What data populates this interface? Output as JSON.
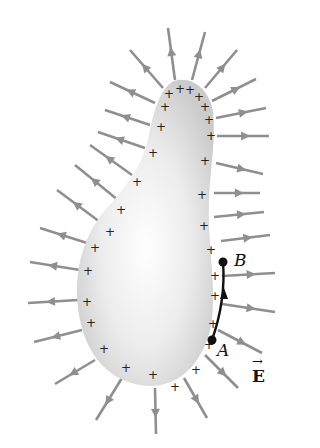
{
  "diagram": {
    "title": "",
    "colors": {
      "background": "#ffffff",
      "conductor_edge": "#c9c9c9",
      "conductor_center": "#ffffff",
      "field_line": "#8f8f8f",
      "charge_mark": "#222222",
      "path": "#111111"
    },
    "labels": {
      "point_a": "A",
      "point_b": "B",
      "field": "E",
      "field_vector_arrow": "→"
    },
    "charge_symbol": "+",
    "conductor_outline": "M178,80 C196,78 210,92 213,112 C216,140 210,170 209,200 C207,240 216,280 212,320 C208,350 188,385 152,386 C115,386 88,360 80,320 C72,280 80,240 105,210 C125,188 140,170 148,140 C152,118 160,82 178,80 Z",
    "charges": [
      [
        169,
        94
      ],
      [
        180,
        89
      ],
      [
        190,
        90
      ],
      [
        199,
        97
      ],
      [
        205,
        107
      ],
      [
        209,
        120
      ],
      [
        211,
        136
      ],
      [
        205,
        161
      ],
      [
        202,
        195
      ],
      [
        204,
        226
      ],
      [
        211,
        250
      ],
      [
        215,
        276
      ],
      [
        215,
        296
      ],
      [
        213,
        324
      ],
      [
        209,
        345
      ],
      [
        196,
        370
      ],
      [
        175,
        387
      ],
      [
        153,
        375
      ],
      [
        126,
        368
      ],
      [
        104,
        349
      ],
      [
        91,
        323
      ],
      [
        87,
        302
      ],
      [
        88,
        271
      ],
      [
        95,
        248
      ],
      [
        110,
        232
      ],
      [
        121,
        210
      ],
      [
        137,
        182
      ],
      [
        153,
        153
      ],
      [
        161,
        127
      ],
      [
        165,
        107
      ]
    ],
    "field_lines": [
      [
        [
          175,
          80
        ],
        [
          168,
          28
        ]
      ],
      [
        [
          192,
          80
        ],
        [
          205,
          32
        ]
      ],
      [
        [
          205,
          88
        ],
        [
          237,
          50
        ]
      ],
      [
        [
          212,
          101
        ],
        [
          256,
          79
        ]
      ],
      [
        [
          216,
          118
        ],
        [
          266,
          108
        ]
      ],
      [
        [
          217,
          136
        ],
        [
          269,
          136
        ]
      ],
      [
        [
          216,
          163
        ],
        [
          263,
          174
        ]
      ],
      [
        [
          214,
          193
        ],
        [
          260,
          193
        ]
      ],
      [
        [
          214,
          217
        ],
        [
          264,
          212
        ]
      ],
      [
        [
          221,
          241
        ],
        [
          270,
          235
        ]
      ],
      [
        [
          222,
          276
        ],
        [
          275,
          273
        ]
      ],
      [
        [
          222,
          304
        ],
        [
          275,
          312
        ]
      ],
      [
        [
          218,
          330
        ],
        [
          262,
          353
        ]
      ],
      [
        [
          205,
          355
        ],
        [
          238,
          388
        ]
      ],
      [
        [
          184,
          378
        ],
        [
          207,
          418
        ]
      ],
      [
        [
          155,
          388
        ],
        [
          156,
          434
        ]
      ],
      [
        [
          122,
          378
        ],
        [
          96,
          420
        ]
      ],
      [
        [
          95,
          360
        ],
        [
          55,
          384
        ]
      ],
      [
        [
          82,
          330
        ],
        [
          34,
          342
        ]
      ],
      [
        [
          78,
          300
        ],
        [
          28,
          303
        ]
      ],
      [
        [
          80,
          270
        ],
        [
          30,
          262
        ]
      ],
      [
        [
          87,
          243
        ],
        [
          40,
          228
        ]
      ],
      [
        [
          100,
          222
        ],
        [
          57,
          190
        ]
      ],
      [
        [
          118,
          200
        ],
        [
          75,
          165
        ]
      ],
      [
        [
          132,
          175
        ],
        [
          90,
          145
        ]
      ],
      [
        [
          145,
          148
        ],
        [
          98,
          132
        ]
      ],
      [
        [
          150,
          125
        ],
        [
          105,
          110
        ]
      ],
      [
        [
          155,
          103
        ],
        [
          110,
          82
        ]
      ],
      [
        [
          163,
          88
        ],
        [
          130,
          50
        ]
      ]
    ],
    "path": {
      "a": [
        212,
        340
      ],
      "b": [
        223,
        262
      ],
      "control": [
        226,
        300
      ]
    }
  }
}
